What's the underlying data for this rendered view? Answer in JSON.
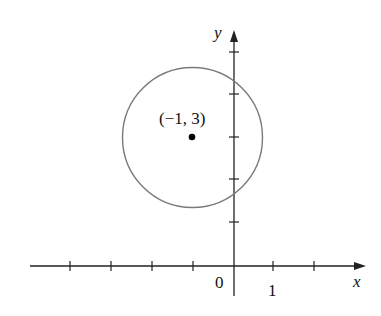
{
  "diagram": {
    "type": "coordinate-plane-circle",
    "axes": {
      "x_label": "x",
      "y_label": "y",
      "origin_label": "0",
      "x_tick_label": "1",
      "x_ticks": [
        -4,
        -3,
        -2,
        -1,
        1,
        2
      ],
      "y_ticks": [
        1,
        2,
        3,
        4,
        5
      ]
    },
    "circle": {
      "center": [
        -1,
        3
      ],
      "radius_units": 1.7,
      "stroke_color": "#7a7a7a"
    },
    "center_point": {
      "label": "(−1, 3)",
      "color": "#000000"
    },
    "colors": {
      "axis": "#222222",
      "background": "#ffffff"
    }
  }
}
